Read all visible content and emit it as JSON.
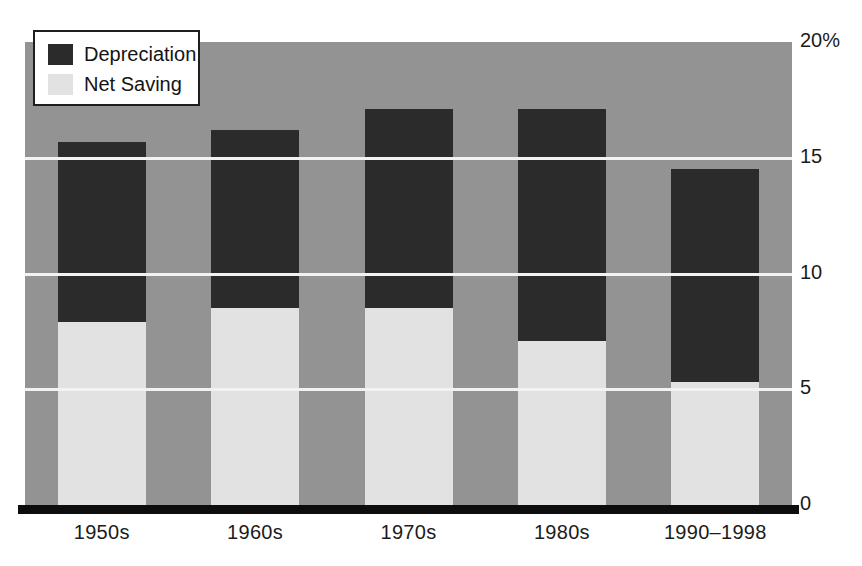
{
  "chart_data": {
    "type": "bar",
    "subtype": "stacked",
    "title": "",
    "subtitle": "",
    "xlabel": "",
    "ylabel": "",
    "categories": [
      "1950s",
      "1960s",
      "1970s",
      "1980s",
      "1990–1998"
    ],
    "series": [
      {
        "name": "Net Saving",
        "values": [
          7.9,
          8.5,
          8.5,
          7.1,
          5.3
        ]
      },
      {
        "name": "Depreciation",
        "values": [
          7.8,
          7.7,
          8.6,
          10.0,
          9.2
        ]
      }
    ],
    "totals": [
      15.7,
      16.2,
      17.1,
      17.1,
      14.5
    ],
    "ylim": [
      0,
      20
    ],
    "y_ticks": [
      {
        "value": 20,
        "label": "20%"
      },
      {
        "value": 15,
        "label": "15"
      },
      {
        "value": 10,
        "label": "10"
      },
      {
        "value": 5,
        "label": "5"
      },
      {
        "value": 0,
        "label": "0"
      }
    ],
    "grid": true,
    "gridlines_at": [
      15,
      10,
      5
    ],
    "legend_position": "top-left",
    "colors": {
      "depreciation": "#2b2b2b",
      "net_saving": "#e2e2e2",
      "plot_background": "#939393",
      "gridline": "#f2f2f2",
      "axis": "#0d0d0d",
      "text": "#1b1b1b",
      "page_background": "#ffffff"
    }
  },
  "legend": {
    "items": [
      {
        "label": "Depreciation",
        "swatch": "depreciation-swatch"
      },
      {
        "label": "Net Saving",
        "swatch": "net-saving-swatch"
      }
    ]
  },
  "axes": {
    "y": {
      "tick_labels": [
        "20%",
        "15",
        "10",
        "5",
        "0"
      ]
    },
    "x": {
      "tick_labels": [
        "1950s",
        "1960s",
        "1970s",
        "1980s",
        "1990–1998"
      ]
    }
  }
}
